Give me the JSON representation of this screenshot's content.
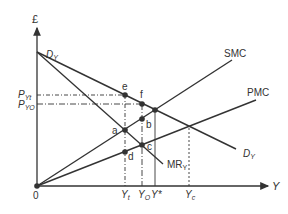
{
  "diagram": {
    "axes": {
      "y_label": "£",
      "x_label": "Y",
      "origin_label": "0"
    },
    "curves": {
      "demand": "D",
      "demand_sub": "Y",
      "mr": "MR",
      "mr_sub": "Y",
      "smc": "SMC",
      "pmc": "PMC"
    },
    "price_labels": [
      {
        "main": "P",
        "sub": "Yt"
      },
      {
        "main": "P",
        "sub": "YO"
      }
    ],
    "quantity_labels": [
      {
        "main": "Y",
        "sub": "t"
      },
      {
        "main": "Y",
        "sub": "O"
      },
      {
        "main": "Y*",
        "sub": ""
      },
      {
        "main": "Y",
        "sub": "c"
      }
    ],
    "points": [
      "e",
      "f",
      "a",
      "b",
      "c",
      "d"
    ],
    "colors": {
      "line": "#333333",
      "text": "#333333"
    }
  }
}
